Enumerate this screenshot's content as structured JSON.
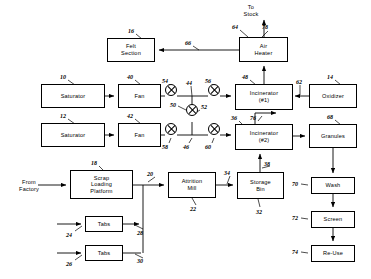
{
  "diagram": {
    "stroke_color": "#000000",
    "background_color": "#ffffff",
    "free_text": [
      {
        "name": "to-stack-label",
        "text": "To\nStock",
        "x": 233,
        "y": 4,
        "w": 36
      },
      {
        "name": "from-factory-label",
        "text": "From\nFactory",
        "x": 9,
        "y": 179,
        "w": 40
      }
    ],
    "nodes": [
      {
        "name": "felt-section",
        "label": "Felt\nSection",
        "x": 107,
        "y": 38,
        "w": 48,
        "h": 24
      },
      {
        "name": "air-heater",
        "label": "Air\nHeater",
        "x": 239,
        "y": 37,
        "w": 49,
        "h": 25
      },
      {
        "name": "saturator-1",
        "label": "Saturator",
        "x": 41,
        "y": 84,
        "w": 64,
        "h": 24
      },
      {
        "name": "fan-1",
        "label": "Fan",
        "x": 118,
        "y": 84,
        "w": 43,
        "h": 24
      },
      {
        "name": "incinerator-1",
        "label": "Incinerator\n(#1)",
        "x": 235,
        "y": 84,
        "w": 58,
        "h": 26
      },
      {
        "name": "oxidizer",
        "label": "Oxidizer",
        "x": 309,
        "y": 84,
        "w": 48,
        "h": 24
      },
      {
        "name": "saturator-2",
        "label": "Saturator",
        "x": 41,
        "y": 123,
        "w": 64,
        "h": 24
      },
      {
        "name": "fan-2",
        "label": "Fan",
        "x": 118,
        "y": 123,
        "w": 43,
        "h": 24
      },
      {
        "name": "incinerator-2",
        "label": "Incinerator\n(#2)",
        "x": 235,
        "y": 124,
        "w": 58,
        "h": 26
      },
      {
        "name": "granules",
        "label": "Granules",
        "x": 309,
        "y": 124,
        "w": 48,
        "h": 24
      },
      {
        "name": "scrap-loading-platform",
        "label": "Scrap\nLoading\nPlatform",
        "x": 70,
        "y": 170,
        "w": 63,
        "h": 29
      },
      {
        "name": "attrition-mill",
        "label": "Attrition\nMill",
        "x": 168,
        "y": 172,
        "w": 48,
        "h": 26
      },
      {
        "name": "storage-bin",
        "label": "Storage\nBin",
        "x": 237,
        "y": 172,
        "w": 47,
        "h": 27
      },
      {
        "name": "wash",
        "label": "Wash",
        "x": 311,
        "y": 177,
        "w": 44,
        "h": 17
      },
      {
        "name": "tabs-1",
        "label": "Tabs",
        "x": 85,
        "y": 216,
        "w": 38,
        "h": 16
      },
      {
        "name": "screen",
        "label": "Screen",
        "x": 311,
        "y": 211,
        "w": 44,
        "h": 17
      },
      {
        "name": "tabs-2",
        "label": "Tabs",
        "x": 85,
        "y": 245,
        "w": 38,
        "h": 16
      },
      {
        "name": "re-use",
        "label": "Re-Use",
        "x": 311,
        "y": 245,
        "w": 44,
        "h": 17
      }
    ],
    "mixers": [
      {
        "name": "mixer-54",
        "x": 165,
        "y": 90,
        "d": 12
      },
      {
        "name": "mixer-56",
        "x": 208,
        "y": 90,
        "d": 12
      },
      {
        "name": "mixer-52",
        "x": 186,
        "y": 110,
        "d": 12
      },
      {
        "name": "mixer-58",
        "x": 165,
        "y": 129,
        "d": 12
      },
      {
        "name": "mixer-60",
        "x": 208,
        "y": 129,
        "d": 12
      }
    ],
    "reference_numerals": [
      {
        "name": "ref-16",
        "text": "16",
        "x": 128,
        "y": 28
      },
      {
        "name": "ref-66",
        "text": "66",
        "x": 185,
        "y": 40
      },
      {
        "name": "ref-64",
        "text": "64",
        "x": 232,
        "y": 24
      },
      {
        "name": "ref-78",
        "text": "78",
        "x": 262,
        "y": 24
      },
      {
        "name": "ref-10",
        "text": "10",
        "x": 60,
        "y": 74
      },
      {
        "name": "ref-40",
        "text": "40",
        "x": 127,
        "y": 74
      },
      {
        "name": "ref-54",
        "text": "54",
        "x": 162,
        "y": 78
      },
      {
        "name": "ref-44",
        "text": "44",
        "x": 186,
        "y": 80
      },
      {
        "name": "ref-56",
        "text": "56",
        "x": 205,
        "y": 78
      },
      {
        "name": "ref-48",
        "text": "48",
        "x": 242,
        "y": 74
      },
      {
        "name": "ref-62",
        "text": "62",
        "x": 296,
        "y": 79
      },
      {
        "name": "ref-14",
        "text": "14",
        "x": 327,
        "y": 74
      },
      {
        "name": "ref-50",
        "text": "50",
        "x": 170,
        "y": 102
      },
      {
        "name": "ref-52",
        "text": "52",
        "x": 201,
        "y": 104
      },
      {
        "name": "ref-12",
        "text": "12",
        "x": 60,
        "y": 113
      },
      {
        "name": "ref-42",
        "text": "42",
        "x": 127,
        "y": 113
      },
      {
        "name": "ref-36",
        "text": "36",
        "x": 231,
        "y": 115
      },
      {
        "name": "ref-76",
        "text": "76",
        "x": 250,
        "y": 115
      },
      {
        "name": "ref-68",
        "text": "68",
        "x": 327,
        "y": 114
      },
      {
        "name": "ref-58",
        "text": "58",
        "x": 162,
        "y": 144
      },
      {
        "name": "ref-46",
        "text": "46",
        "x": 183,
        "y": 144
      },
      {
        "name": "ref-60",
        "text": "60",
        "x": 205,
        "y": 144
      },
      {
        "name": "ref-18",
        "text": "18",
        "x": 91,
        "y": 160
      },
      {
        "name": "ref-20",
        "text": "20",
        "x": 147,
        "y": 171
      },
      {
        "name": "ref-38",
        "text": "38",
        "x": 264,
        "y": 161
      },
      {
        "name": "ref-34",
        "text": "34",
        "x": 224,
        "y": 170
      },
      {
        "name": "ref-70",
        "text": "70",
        "x": 292,
        "y": 181
      },
      {
        "name": "ref-22",
        "text": "22",
        "x": 190,
        "y": 206
      },
      {
        "name": "ref-32",
        "text": "32",
        "x": 256,
        "y": 209
      },
      {
        "name": "ref-72",
        "text": "72",
        "x": 292,
        "y": 215
      },
      {
        "name": "ref-24",
        "text": "24",
        "x": 66,
        "y": 232
      },
      {
        "name": "ref-28",
        "text": "28",
        "x": 137,
        "y": 230
      },
      {
        "name": "ref-74",
        "text": "74",
        "x": 292,
        "y": 249
      },
      {
        "name": "ref-26",
        "text": "26",
        "x": 66,
        "y": 261
      },
      {
        "name": "ref-30",
        "text": "30",
        "x": 137,
        "y": 258
      }
    ],
    "connections": [
      {
        "name": "wire-saturator1-to-fan1"
      },
      {
        "name": "wire-fan1-to-mixer54"
      },
      {
        "name": "wire-mixer54-to-mixer56"
      },
      {
        "name": "wire-mixer56-to-incinerator1"
      },
      {
        "name": "wire-saturator2-to-fan2"
      },
      {
        "name": "wire-fan2-to-mixer58"
      },
      {
        "name": "wire-mixer58-to-mixer60"
      },
      {
        "name": "wire-mixer60-to-incinerator2"
      },
      {
        "name": "wire-mixer52-vertical-trunk"
      },
      {
        "name": "wire-oxidizer-to-incinerator1"
      },
      {
        "name": "wire-incinerator1-to-air-heater"
      },
      {
        "name": "wire-air-heater-to-stack"
      },
      {
        "name": "wire-air-heater-to-felt-section"
      },
      {
        "name": "wire-incinerator2-exhaust"
      },
      {
        "name": "wire-incinerator2-to-granules"
      },
      {
        "name": "wire-granules-to-wash"
      },
      {
        "name": "wire-wash-to-screen"
      },
      {
        "name": "wire-screen-to-reuse"
      },
      {
        "name": "wire-from-factory-to-platform"
      },
      {
        "name": "wire-platform-to-attrition-mill"
      },
      {
        "name": "wire-attrition-mill-to-storage-bin"
      },
      {
        "name": "wire-storage-bin-to-incinerator2"
      },
      {
        "name": "wire-tabs1-in"
      },
      {
        "name": "wire-tabs1-to-trunk"
      },
      {
        "name": "wire-tabs2-in"
      },
      {
        "name": "wire-tabs2-to-trunk"
      }
    ]
  }
}
